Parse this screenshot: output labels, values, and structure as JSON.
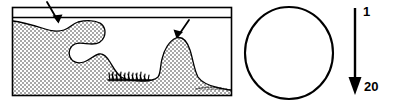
{
  "figure": {
    "background_color": "#ffffff",
    "stroke_color": "#000000",
    "stipple_fill_color": "#b9b9b9",
    "width": 395,
    "height": 105
  },
  "cross_section_panel": {
    "name": "cross-section-panel",
    "frame": {
      "x": 12,
      "y": 7,
      "width": 220,
      "height": 89
    },
    "water_line_y": 17,
    "stipple_region_label": "stippled-substrate",
    "surface_contour": "irregular sediment surface profile with overhang at left, trough at centre and mound at right",
    "annotations": [
      {
        "name": "arrow-upper-left",
        "label": "",
        "target_x": 57,
        "target_y": 22
      },
      {
        "name": "arrow-mound",
        "label": "",
        "target_x": 177,
        "target_y": 39
      }
    ],
    "textures": [
      {
        "name": "grass-tuft-texture",
        "x": 108,
        "y": 78,
        "width": 40,
        "height": 8
      },
      {
        "name": "fine-debris-texture",
        "x": 196,
        "y": 86,
        "width": 35,
        "height": 6
      }
    ]
  },
  "circle_panel": {
    "name": "circle-outline",
    "center_x": 289,
    "center_y": 53,
    "radius_x": 44,
    "radius_y": 46,
    "fill": "none",
    "stroke_width": 2
  },
  "scale_arrow": {
    "name": "scale-arrow",
    "top_label": "1",
    "bottom_label": "20",
    "shaft_x": 355,
    "top_y": 8,
    "bottom_y": 92,
    "direction": "down"
  }
}
